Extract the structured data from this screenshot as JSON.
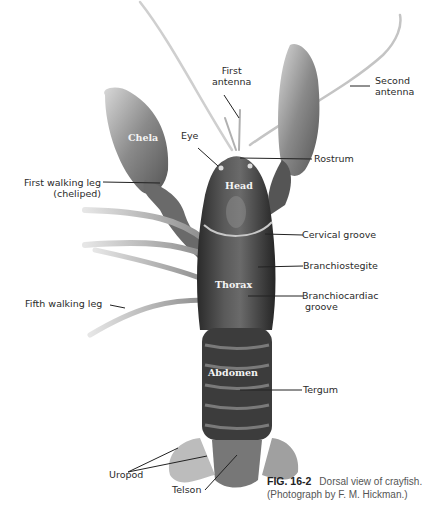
{
  "figure": {
    "number": "FIG. 16-2",
    "caption_line1": "Dorsal view of crayfish.",
    "caption_line2": "(Photograph by F. M. Hickman.)"
  },
  "labels": {
    "first_antenna_1": "First",
    "first_antenna_2": "antenna",
    "second_antenna_1": "Second",
    "second_antenna_2": "antenna",
    "eye": "Eye",
    "rostrum": "Rostrum",
    "first_walking_leg_1": "First walking leg",
    "first_walking_leg_2": "(cheliped)",
    "cervical_groove": "Cervical groove",
    "branchiostegite": "Branchiostegite",
    "branchiocardiac_1": "Branchiocardiac",
    "branchiocardiac_2": "groove",
    "fifth_walking_leg": "Fifth walking leg",
    "tergum": "Tergum",
    "uropod": "Uropod",
    "telson": "Telson"
  },
  "inner_labels": {
    "chela": "Chela",
    "head": "Head",
    "thorax": "Thorax",
    "abdomen": "Abdomen"
  }
}
